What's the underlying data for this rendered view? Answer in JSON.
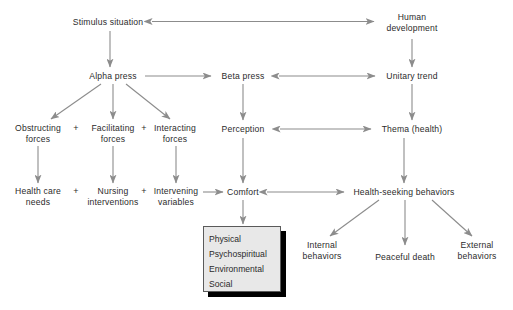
{
  "diagram": {
    "arrow_color": "#8c8c8c",
    "text_color": "#2b2b2b",
    "background_color": "#ffffff",
    "box_fill_color": "#e8e8e8",
    "box_border_color": "#5a5a5a",
    "box_shadow_color": "#000000",
    "nodes": [
      {
        "id": "stimulus-situation",
        "label": "Stimulus situation",
        "x": 108,
        "y": 22
      },
      {
        "id": "human-development",
        "label": "Human\ndevelopment",
        "x": 412,
        "y": 22
      },
      {
        "id": "alpha-press",
        "label": "Alpha press",
        "x": 113,
        "y": 76
      },
      {
        "id": "beta-press",
        "label": "Beta press",
        "x": 243,
        "y": 76
      },
      {
        "id": "unitary-trend",
        "label": "Unitary trend",
        "x": 412,
        "y": 76
      },
      {
        "id": "obstructing-forces",
        "label": "Obstructing\nforces",
        "x": 38,
        "y": 133
      },
      {
        "id": "facilitating-forces",
        "label": "Facilitating\nforces",
        "x": 113,
        "y": 133
      },
      {
        "id": "interacting-forces",
        "label": "Interacting\nforces",
        "x": 175,
        "y": 133
      },
      {
        "id": "perception",
        "label": "Perception",
        "x": 243,
        "y": 129
      },
      {
        "id": "thema-health",
        "label": "Thema (health)",
        "x": 412,
        "y": 129
      },
      {
        "id": "health-care-needs",
        "label": "Health care\nneeds",
        "x": 38,
        "y": 196
      },
      {
        "id": "nursing-interventions",
        "label": "Nursing\ninterventions",
        "x": 113,
        "y": 196
      },
      {
        "id": "intervening-variables",
        "label": "Intervening\nvariables",
        "x": 176,
        "y": 196
      },
      {
        "id": "comfort",
        "label": "Comfort",
        "x": 243,
        "y": 192
      },
      {
        "id": "health-seeking-behaviors",
        "label": "Health-seeking behaviors",
        "x": 404,
        "y": 192
      },
      {
        "id": "internal-behaviors",
        "label": "Internal\nbehaviors",
        "x": 322,
        "y": 250
      },
      {
        "id": "peaceful-death",
        "label": "Peaceful death",
        "x": 405,
        "y": 257
      },
      {
        "id": "external-behaviors",
        "label": "External\nbehaviors",
        "x": 477,
        "y": 250
      }
    ],
    "plus_signs": [
      {
        "id": "plus-forces-1",
        "label": "+",
        "x": 76,
        "y": 128
      },
      {
        "id": "plus-forces-2",
        "label": "+",
        "x": 144,
        "y": 128
      },
      {
        "id": "plus-outcome-1",
        "label": "+",
        "x": 76,
        "y": 191
      },
      {
        "id": "plus-outcome-2",
        "label": "+",
        "x": 144,
        "y": 191
      }
    ],
    "concept_box": {
      "id": "comfort-types-box",
      "items": [
        {
          "id": "physical",
          "label": "Physical"
        },
        {
          "id": "psychospiritual",
          "label": "Psychospiritual"
        },
        {
          "id": "environmental",
          "label": "Environmental"
        },
        {
          "id": "social",
          "label": "Social"
        }
      ]
    },
    "connections": [
      {
        "id": "human-development-to-stimulus-situation",
        "type": "double",
        "from": "human-development",
        "to": "stimulus-situation"
      },
      {
        "id": "stimulus-situation-to-alpha-press",
        "type": "single",
        "from": "stimulus-situation",
        "to": "alpha-press"
      },
      {
        "id": "human-development-to-unitary-trend",
        "type": "single",
        "from": "human-development",
        "to": "unitary-trend"
      },
      {
        "id": "alpha-press-to-beta-press",
        "type": "single",
        "from": "alpha-press",
        "to": "beta-press"
      },
      {
        "id": "beta-press-to-unitary-trend",
        "type": "double",
        "from": "beta-press",
        "to": "unitary-trend"
      },
      {
        "id": "alpha-press-to-obstructing-forces",
        "type": "single",
        "from": "alpha-press",
        "to": "obstructing-forces"
      },
      {
        "id": "alpha-press-to-facilitating-forces",
        "type": "single",
        "from": "alpha-press",
        "to": "facilitating-forces"
      },
      {
        "id": "alpha-press-to-interacting-forces",
        "type": "single",
        "from": "alpha-press",
        "to": "interacting-forces"
      },
      {
        "id": "beta-press-to-perception",
        "type": "single",
        "from": "beta-press",
        "to": "perception"
      },
      {
        "id": "unitary-trend-to-thema-health",
        "type": "single",
        "from": "unitary-trend",
        "to": "thema-health"
      },
      {
        "id": "perception-to-thema-health",
        "type": "double",
        "from": "perception",
        "to": "thema-health"
      },
      {
        "id": "obstructing-to-health-care-needs",
        "type": "single",
        "from": "obstructing-forces",
        "to": "health-care-needs"
      },
      {
        "id": "facilitating-to-nursing-interventions",
        "type": "single",
        "from": "facilitating-forces",
        "to": "nursing-interventions"
      },
      {
        "id": "interacting-to-intervening-variables",
        "type": "single",
        "from": "interacting-forces",
        "to": "intervening-variables"
      },
      {
        "id": "perception-to-comfort",
        "type": "single",
        "from": "perception",
        "to": "comfort"
      },
      {
        "id": "intervening-variables-to-comfort",
        "type": "single",
        "from": "intervening-variables",
        "to": "comfort"
      },
      {
        "id": "thema-health-to-health-seeking",
        "type": "single",
        "from": "thema-health",
        "to": "health-seeking-behaviors"
      },
      {
        "id": "comfort-to-health-seeking-behaviors",
        "type": "double",
        "from": "comfort",
        "to": "health-seeking-behaviors"
      },
      {
        "id": "comfort-to-comfort-types-box",
        "type": "single",
        "from": "comfort",
        "to": "comfort-types-box"
      },
      {
        "id": "health-seeking-to-internal-behaviors",
        "type": "single",
        "from": "health-seeking-behaviors",
        "to": "internal-behaviors"
      },
      {
        "id": "health-seeking-to-peaceful-death",
        "type": "single",
        "from": "health-seeking-behaviors",
        "to": "peaceful-death"
      },
      {
        "id": "health-seeking-to-external-behaviors",
        "type": "single",
        "from": "health-seeking-behaviors",
        "to": "external-behaviors"
      }
    ]
  },
  "caption": {
    "text": ""
  }
}
